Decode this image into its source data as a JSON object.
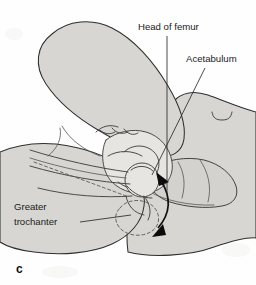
{
  "figure": {
    "panel_letter": "c",
    "background_color": "#fefefe",
    "skin_fill_color": "#d7d6d3",
    "bone_fill_color": "#e6e5e2",
    "outline_color": "#2f2f2f",
    "arrow_color": "#0c0c0c"
  },
  "labels": [
    {
      "id": "head-of-femur",
      "text": "Head of femur",
      "text_x": 138,
      "text_y": 30,
      "leader_kind": "vertical",
      "leader_points": "167,36 167,194"
    },
    {
      "id": "acetabulum",
      "text": "Acetabulum",
      "text_x": 186,
      "text_y": 62,
      "leader_kind": "diagonal",
      "leader_points": "205,68 152,175"
    },
    {
      "id": "greater-trochanter",
      "text_line_1": "Greater",
      "text_line_2": "trochanter",
      "text_x": 14,
      "text_y_line_1": 210,
      "text_y_line_2": 225,
      "leader_kind": "horizontal",
      "leader_points": "80,222 130,216"
    }
  ],
  "motion_arrow": {
    "id": "rotation-arrow",
    "description": "double-headed curved arrow indicating hip rotation",
    "arc_path": "M 160 178 Q 176 205 157 231",
    "head_count": 2
  },
  "anatomy_parts": [
    {
      "id": "thigh",
      "label": "flexed thigh"
    },
    {
      "id": "trunk",
      "label": "infant trunk"
    },
    {
      "id": "pelvis",
      "label": "pelvis"
    },
    {
      "id": "femoral-head",
      "label": "femoral head in acetabulum"
    },
    {
      "id": "femur-shaft",
      "label": "femoral shaft"
    },
    {
      "id": "displaced-outline",
      "label": "dashed displaced position"
    },
    {
      "id": "examiner-hand",
      "label": "examiner hand and fingers"
    },
    {
      "id": "umbilicus",
      "label": "umbilicus mark"
    }
  ]
}
